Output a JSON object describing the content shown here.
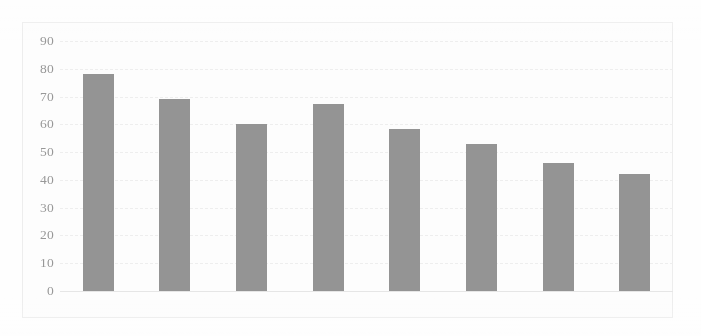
{
  "chart_data": {
    "type": "bar",
    "title": "",
    "xlabel": "",
    "ylabel": "",
    "categories": [
      "2011",
      "2012",
      "2013",
      "2014",
      "2015",
      "2016",
      "2017",
      "2018"
    ],
    "values": [
      78,
      69,
      60,
      67.5,
      58.5,
      53,
      46,
      42
    ],
    "ylim": [
      0,
      90
    ],
    "ytick_labels": [
      "90",
      "80",
      "70",
      "60",
      "50",
      "40",
      "30",
      "20",
      "10",
      "0"
    ],
    "ytick_values": [
      90,
      80,
      70,
      60,
      50,
      40,
      30,
      20,
      10,
      0
    ],
    "ystep": 10,
    "grid": true,
    "legend": "none",
    "series": [
      {
        "name": "",
        "values": [
          78,
          69,
          60,
          67.5,
          58.5,
          53,
          46,
          42
        ]
      }
    ],
    "colors": {
      "bar": "#8c8c8c",
      "gridline": "#ededed",
      "tick_text": "#909090",
      "plot_background": "#fdfdfd",
      "frame_border": "#ececec"
    }
  }
}
